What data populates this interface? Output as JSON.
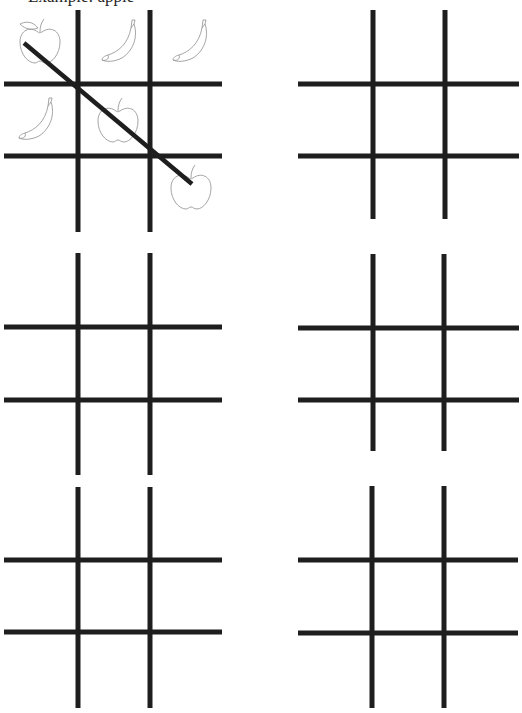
{
  "header": {
    "instruction_text": "Example: apple"
  },
  "colors": {
    "line": "#1e1e1e",
    "fruit_outline": "#9a9a9a",
    "background": "#ffffff"
  },
  "boards": [
    {
      "id": "board-1",
      "label": "Example board",
      "cells": [
        "apple",
        "banana",
        "banana",
        "banana",
        "apple",
        "",
        "",
        "",
        "apple"
      ],
      "winning_line": "diagonal-top-left-to-bottom-right",
      "winner": "apple"
    },
    {
      "id": "board-2",
      "cells": [
        "",
        "",
        "",
        "",
        "",
        "",
        "",
        "",
        ""
      ]
    },
    {
      "id": "board-3",
      "cells": [
        "",
        "",
        "",
        "",
        "",
        "",
        "",
        "",
        ""
      ]
    },
    {
      "id": "board-4",
      "cells": [
        "",
        "",
        "",
        "",
        "",
        "",
        "",
        "",
        ""
      ]
    },
    {
      "id": "board-5",
      "cells": [
        "",
        "",
        "",
        "",
        "",
        "",
        "",
        "",
        ""
      ]
    },
    {
      "id": "board-6",
      "cells": [
        "",
        "",
        "",
        "",
        "",
        "",
        "",
        "",
        ""
      ]
    }
  ]
}
